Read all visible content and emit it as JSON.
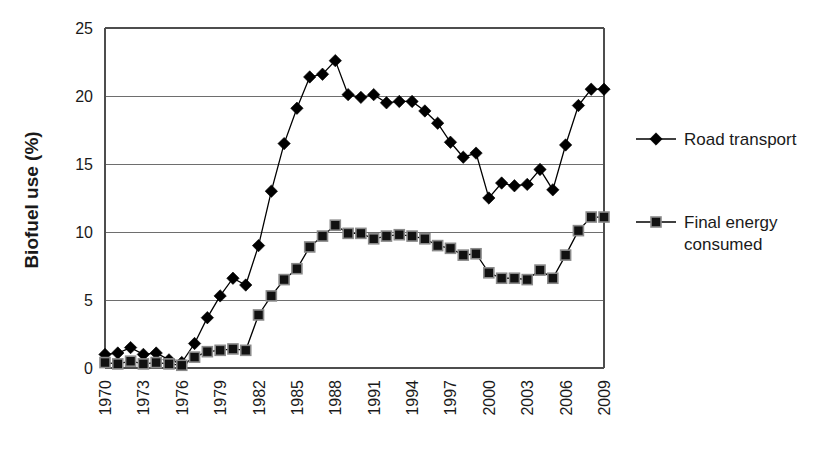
{
  "chart_data": {
    "type": "line",
    "title": "",
    "xlabel": "",
    "ylabel": "Biofuel use (%)",
    "ylim": [
      0,
      25
    ],
    "yticks": [
      0,
      5,
      10,
      15,
      20,
      25
    ],
    "ytick_labels": [
      "0",
      "5",
      "10",
      "15",
      "20",
      "25"
    ],
    "grid": true,
    "legend_position": "right",
    "x": [
      1970,
      1971,
      1972,
      1973,
      1974,
      1975,
      1976,
      1977,
      1978,
      1979,
      1980,
      1981,
      1982,
      1983,
      1984,
      1985,
      1986,
      1987,
      1988,
      1989,
      1990,
      1991,
      1992,
      1993,
      1994,
      1995,
      1996,
      1997,
      1998,
      1999,
      2000,
      2001,
      2002,
      2003,
      2004,
      2005,
      2006,
      2007,
      2008,
      2009
    ],
    "xtick_labels": [
      "1970",
      "1973",
      "1976",
      "1979",
      "1982",
      "1985",
      "1988",
      "1991",
      "1994",
      "1997",
      "2000",
      "2003",
      "2006",
      "2009"
    ],
    "xtick_values": [
      1970,
      1973,
      1976,
      1979,
      1982,
      1985,
      1988,
      1991,
      1994,
      1997,
      2000,
      2003,
      2006,
      2009
    ],
    "series": [
      {
        "name": "Road transport",
        "marker": "diamond",
        "color": "#000000",
        "values": [
          1.0,
          1.1,
          1.5,
          1.0,
          1.1,
          0.6,
          0.4,
          1.8,
          3.7,
          5.3,
          6.6,
          6.1,
          9.0,
          13.0,
          16.5,
          19.1,
          21.4,
          21.6,
          22.6,
          20.1,
          19.9,
          20.1,
          19.5,
          19.6,
          19.6,
          18.9,
          18.0,
          16.6,
          15.5,
          15.8,
          12.5,
          13.6,
          13.4,
          13.5,
          14.6,
          13.1,
          16.4,
          19.3,
          20.5,
          20.5
        ]
      },
      {
        "name": "Final energy consumed",
        "marker": "square",
        "color": "#000000",
        "values": [
          0.4,
          0.3,
          0.5,
          0.3,
          0.4,
          0.3,
          0.2,
          0.8,
          1.2,
          1.3,
          1.4,
          1.3,
          3.9,
          5.3,
          6.5,
          7.3,
          8.9,
          9.7,
          10.5,
          9.9,
          9.9,
          9.5,
          9.7,
          9.8,
          9.7,
          9.5,
          9.0,
          8.8,
          8.3,
          8.4,
          7.0,
          6.6,
          6.6,
          6.5,
          7.2,
          6.6,
          8.3,
          10.1,
          11.1,
          11.1
        ]
      }
    ]
  },
  "legend": {
    "items": [
      {
        "label": "Road transport",
        "marker": "diamond"
      },
      {
        "label": "Final energy consumed",
        "marker": "square"
      }
    ]
  }
}
